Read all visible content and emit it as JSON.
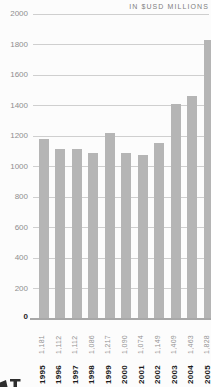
{
  "chart_data": {
    "type": "bar",
    "title": "IN $USD MILLIONS",
    "xlabel": "",
    "ylabel": "",
    "categories": [
      "1995",
      "1996",
      "1997",
      "1998",
      "1999",
      "2000",
      "2001",
      "2002",
      "2003",
      "2004",
      "2005"
    ],
    "values": [
      1181,
      1112,
      1112,
      1086,
      1217,
      1090,
      1074,
      1149,
      1409,
      1463,
      1828
    ],
    "value_labels": [
      "1,181",
      "1,112",
      "1,112",
      "1,086",
      "1,217",
      "1,090",
      "1,074",
      "1,149",
      "1,409",
      "1,463",
      "1,828"
    ],
    "ylim": [
      0,
      2000
    ],
    "ytick_interval": 200,
    "grid": true,
    "legend": "none",
    "bar_color": "#b5b5b5",
    "grid_color": "#cfcfcf",
    "baseline_color": "#a8a8a8",
    "tick_label_color": "#8f8f8f",
    "zero_tick_color": "#1f1f1f",
    "value_label_color": "#939393",
    "year_label_color": "#1b1b1b",
    "unit_label_color": "#7f7f7f"
  }
}
